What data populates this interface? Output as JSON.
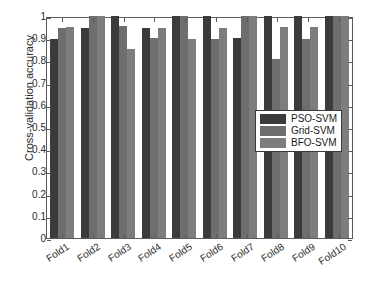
{
  "chart_data": {
    "type": "bar",
    "title": "",
    "xlabel": "",
    "ylabel": "Cross-validation accuracy",
    "ylim": [
      0,
      1
    ],
    "ytick_labels": [
      "1",
      "0.9",
      "0.8",
      "0.7",
      "0.6",
      "0.5",
      "0.4",
      "0.3",
      "0.2",
      "0.1",
      "0"
    ],
    "ytick_values": [
      1,
      0.9,
      0.8,
      0.7,
      0.6,
      0.5,
      0.4,
      0.3,
      0.2,
      0.1,
      0
    ],
    "grid": false,
    "legend_position": "center-right",
    "categories": [
      "Fold1",
      "Fold2",
      "Fold3",
      "Fold4",
      "Fold5",
      "Fold6",
      "Fold7",
      "Fold8",
      "Fold9",
      "Fold10"
    ],
    "series": [
      {
        "name": "PSO-SVM",
        "color": "#3b3b3b",
        "values": [
          0.895,
          0.945,
          1.0,
          0.945,
          1.0,
          1.0,
          0.9,
          1.0,
          1.0,
          1.0
        ]
      },
      {
        "name": "Grid-SVM",
        "color": "#6e6e6e",
        "values": [
          0.945,
          1.0,
          0.955,
          0.9,
          1.0,
          0.895,
          1.0,
          0.805,
          0.895,
          1.0
        ]
      },
      {
        "name": "BFO-SVM",
        "color": "#7d7d7d",
        "values": [
          0.95,
          1.0,
          0.85,
          0.945,
          0.895,
          0.945,
          1.0,
          0.95,
          0.95,
          1.0
        ]
      }
    ]
  },
  "axes": {
    "frame_color": "#5a5a5a",
    "background": "#ffffff"
  },
  "legend": {
    "entries": [
      {
        "label": "PSO-SVM",
        "color": "#3b3b3b"
      },
      {
        "label": "Grid-SVM",
        "color": "#6e6e6e"
      },
      {
        "label": "BFO-SVM",
        "color": "#7d7d7d"
      }
    ]
  }
}
